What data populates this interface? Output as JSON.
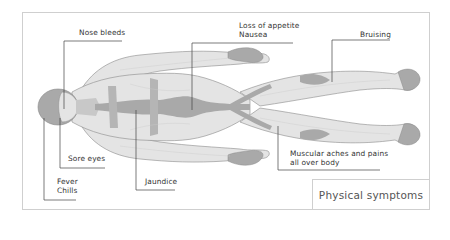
{
  "diagram": {
    "title": "Physical symptoms",
    "labels": {
      "nose_bleeds": "Nose bleeds",
      "loss_of_appetite": "Loss of appetite",
      "nausea": "Nausea",
      "bruising": "Bruising",
      "sore_eyes": "Sore eyes",
      "fever": "Fever",
      "chills": "Chills",
      "jaundice": "Jaundice",
      "muscular_aches_line1": "Muscular aches and pains",
      "muscular_aches_line2": "all over body"
    },
    "colors": {
      "skin": "#e4e4e4",
      "shade": "#a9a9a9",
      "outline": "#8a8a8a",
      "leader": "#444444",
      "frame": "#cfcfcf"
    }
  }
}
